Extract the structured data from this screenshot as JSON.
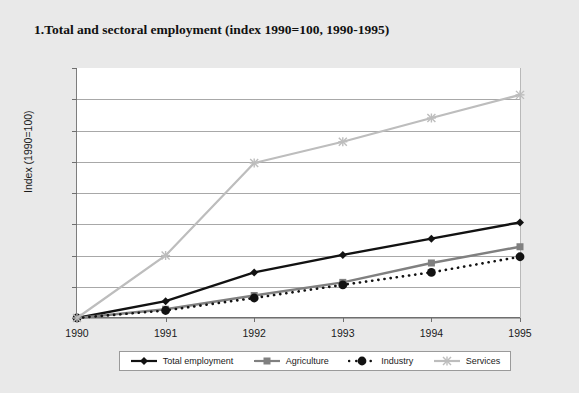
{
  "figure": {
    "number": "1.",
    "title": "Total and sectoral employment (index 1990=100, 1990-1995)"
  },
  "chart_data": {
    "type": "line",
    "title": "Total and sectoral employment (index 1990=100, 1990-1995)",
    "xlabel": "",
    "ylabel": "Index (1990=100)",
    "x": [
      1990,
      1991,
      1992,
      1993,
      1994,
      1995
    ],
    "xtick_labels": [
      "1990",
      "1991",
      "1992",
      "1993",
      "1994",
      "1995"
    ],
    "ytick_labels": [
      "100",
      "105",
      "110",
      "115",
      "120",
      "125",
      "130",
      "135",
      "140"
    ],
    "ylim": [
      100,
      140
    ],
    "ytick_step": 5,
    "xlim": [
      1990,
      1995
    ],
    "grid": "horizontal",
    "legend_position": "bottom",
    "series": [
      {
        "name": "Total employment",
        "color": "#121212",
        "marker": "diamond",
        "line_style": "solid",
        "values": [
          100,
          102.7,
          107.3,
          110.1,
          112.7,
          115.3
        ]
      },
      {
        "name": "Agriculture",
        "color": "#808080",
        "marker": "square",
        "line_style": "solid",
        "values": [
          100,
          101.4,
          103.6,
          105.7,
          108.8,
          111.4
        ]
      },
      {
        "name": "Industry",
        "color": "#121212",
        "marker": "circle",
        "line_style": "dotted",
        "values": [
          100,
          101.2,
          103.2,
          105.3,
          107.3,
          109.8
        ]
      },
      {
        "name": "Services",
        "color": "#bdbdbd",
        "marker": "star",
        "line_style": "solid",
        "values": [
          100,
          110.0,
          124.8,
          128.2,
          132.0,
          135.7
        ]
      }
    ]
  },
  "legend": {
    "items": [
      {
        "label": "Total employment"
      },
      {
        "label": "Agriculture"
      },
      {
        "label": "Industry"
      },
      {
        "label": "Services"
      }
    ]
  }
}
